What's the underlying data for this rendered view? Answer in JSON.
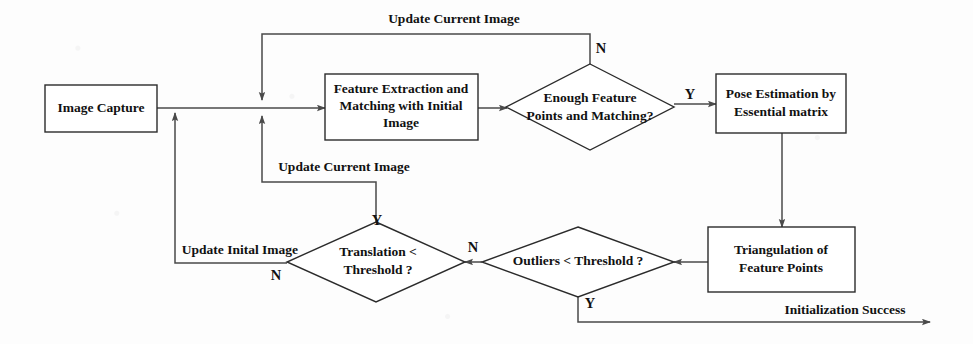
{
  "diagram": {
    "type": "flowchart",
    "canvas": {
      "width": 973,
      "height": 344
    },
    "colors": {
      "background": "#fdfdfd",
      "shape_stroke": "#2b2b2b",
      "shape_fill": "#ffffff",
      "edge_stroke": "#4a4a4a",
      "text": "#111111"
    },
    "nodes": [
      {
        "id": "image-capture",
        "shape": "rectangle",
        "label": "Image Capture",
        "lines": [
          "Image Capture"
        ],
        "x": 45,
        "y": 85,
        "w": 112,
        "h": 47
      },
      {
        "id": "feature-extraction",
        "shape": "rectangle",
        "label": "Feature Extraction and Matching with Initial Image",
        "lines": [
          "Feature Extraction and",
          "Matching with Initial",
          "Image"
        ],
        "x": 325,
        "y": 74,
        "w": 153,
        "h": 66
      },
      {
        "id": "enough-features",
        "shape": "diamond",
        "label": "Enough Feature Points  and Matching?",
        "lines": [
          "Enough Feature",
          "Points  and Matching?"
        ],
        "cx": 590,
        "cy": 107,
        "rx": 84,
        "ry": 43
      },
      {
        "id": "pose-estimation",
        "shape": "rectangle",
        "label": "Pose Estimation by Essential matrix",
        "lines": [
          "Pose Estimation by",
          "Essential matrix"
        ],
        "x": 716,
        "y": 74,
        "w": 130,
        "h": 59
      },
      {
        "id": "triangulation",
        "shape": "rectangle",
        "label": "Triangulation of Feature Points",
        "lines": [
          "Triangulation of",
          "Feature Points"
        ],
        "x": 708,
        "y": 227,
        "w": 147,
        "h": 65
      },
      {
        "id": "outliers-threshold",
        "shape": "diamond",
        "label": "Outliers < Threshold ?",
        "lines": [
          "Outliers < Threshold ?"
        ],
        "cx": 578,
        "cy": 262,
        "rx": 96,
        "ry": 35
      },
      {
        "id": "translation-threshold",
        "shape": "diamond",
        "label": "Translation < Threshold ?",
        "lines": [
          "Translation <",
          "Threshold ?"
        ],
        "cx": 376,
        "cy": 262,
        "rx": 89,
        "ry": 40
      }
    ],
    "edge_labels": [
      {
        "id": "update-current-image-top",
        "text": "Update Current Image",
        "x": 454,
        "y": 20
      },
      {
        "id": "update-current-image-mid",
        "text": "Update Current Image",
        "x": 344,
        "y": 168
      },
      {
        "id": "update-inital-image",
        "text": "Update Inital Image",
        "x": 240,
        "y": 251
      },
      {
        "id": "initialization-success",
        "text": "Initialization Success",
        "x": 845,
        "y": 311
      }
    ],
    "branch_labels": [
      {
        "id": "branch-n-enough-features",
        "text": "N",
        "x": 601,
        "y": 50
      },
      {
        "id": "branch-y-enough-features",
        "text": "Y",
        "x": 690,
        "y": 96
      },
      {
        "id": "branch-y-translation",
        "text": "Y",
        "x": 377,
        "y": 222
      },
      {
        "id": "branch-n-translation",
        "text": "N",
        "x": 276,
        "y": 277
      },
      {
        "id": "branch-n-outliers",
        "text": "N",
        "x": 473,
        "y": 249
      },
      {
        "id": "branch-y-outliers",
        "text": "Y",
        "x": 590,
        "y": 305
      }
    ],
    "edges": [
      {
        "id": "edge-capture-to-junction",
        "from": "image-capture",
        "to": "junction"
      },
      {
        "id": "edge-junction-to-feature",
        "from": "junction",
        "to": "feature-extraction"
      },
      {
        "id": "edge-feature-to-enough",
        "from": "feature-extraction",
        "to": "enough-features"
      },
      {
        "id": "edge-enough-yes-to-pose",
        "from": "enough-features",
        "to": "pose-estimation",
        "label": "Y"
      },
      {
        "id": "edge-enough-no-loop-top",
        "from": "enough-features",
        "to": "junction",
        "label": "N"
      },
      {
        "id": "edge-pose-to-triangulation",
        "from": "pose-estimation",
        "to": "triangulation"
      },
      {
        "id": "edge-triangulation-to-outliers",
        "from": "triangulation",
        "to": "outliers-threshold"
      },
      {
        "id": "edge-outliers-no-to-translation",
        "from": "outliers-threshold",
        "to": "translation-threshold",
        "label": "N"
      },
      {
        "id": "edge-outliers-yes-to-success",
        "from": "outliers-threshold",
        "to": "initialization-success",
        "label": "Y"
      },
      {
        "id": "edge-translation-yes-loop",
        "from": "translation-threshold",
        "to": "junction",
        "label": "Y"
      },
      {
        "id": "edge-translation-no-to-capture",
        "from": "translation-threshold",
        "to": "image-capture",
        "label": "N"
      }
    ]
  }
}
